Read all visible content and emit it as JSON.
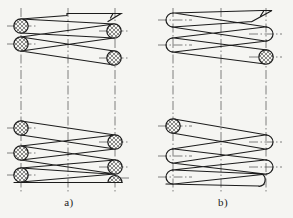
{
  "figure": {
    "background": "#f5f5f2",
    "colors": {
      "line": "#1c1c1c",
      "centerline": "#3f3f3f",
      "label": "#1c1c1c"
    },
    "panels": [
      {
        "id": "a",
        "label": "a)"
      },
      {
        "id": "b",
        "label": "b)"
      }
    ]
  }
}
